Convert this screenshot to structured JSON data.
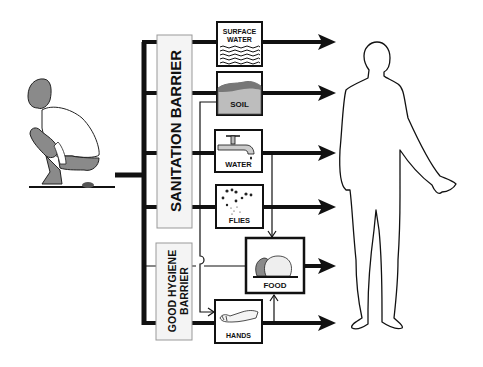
{
  "barriers": {
    "sanitation": "SANITATION BARRIER",
    "hygiene_line1": "GOOD HYGIENE",
    "hygiene_line2": "BARRIER"
  },
  "pathways": [
    {
      "id": "surface-water",
      "line1": "SURFACE",
      "line2": "WATER"
    },
    {
      "id": "soil",
      "label": "SOIL"
    },
    {
      "id": "water",
      "label": "WATER"
    },
    {
      "id": "flies",
      "label": "FLIES"
    },
    {
      "id": "food",
      "label": "FOOD"
    },
    {
      "id": "hands",
      "label": "HANDS"
    }
  ],
  "colors": {
    "line": "#111111",
    "barrier_fill": "#f4f4f4",
    "barrier_stroke": "#999999",
    "soil_fill": "#bdbdbd",
    "skin_fill": "#8a8a8a"
  }
}
